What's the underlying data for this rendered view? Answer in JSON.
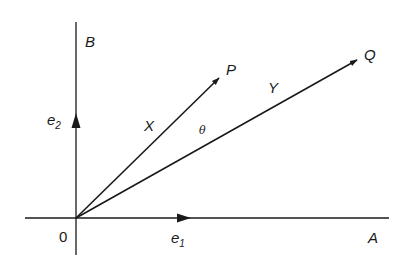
{
  "diagram": {
    "type": "vector-diagram",
    "origin_label": "0",
    "axes": {
      "horizontal": {
        "label": "A",
        "unit_vector": {
          "base": "e",
          "subscript": "1"
        }
      },
      "vertical": {
        "label": "B",
        "unit_vector": {
          "base": "e",
          "subscript": "2"
        }
      }
    },
    "vectors": [
      {
        "endpoint_label": "P",
        "vector_label": "X"
      },
      {
        "endpoint_label": "Q",
        "vector_label": "Y"
      }
    ],
    "angle_label": "θ",
    "colors": {
      "stroke": "#1a1a1a",
      "background": "#ffffff"
    }
  }
}
